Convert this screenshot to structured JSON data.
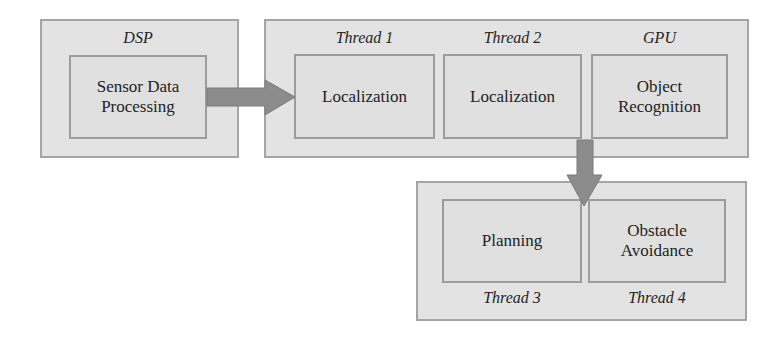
{
  "diagram": {
    "groups": [
      {
        "id": "dsp",
        "label": "DSP",
        "boxes": [
          {
            "id": "sensor-data-processing",
            "text": "Sensor Data\nProcessing"
          }
        ]
      },
      {
        "id": "compute",
        "labels": [
          "Thread 1",
          "Thread 2",
          "GPU"
        ],
        "boxes": [
          {
            "id": "localization-1",
            "text": "Localization"
          },
          {
            "id": "localization-2",
            "text": "Localization"
          },
          {
            "id": "object-recognition",
            "text": "Object\nRecognition"
          }
        ]
      },
      {
        "id": "planning-group",
        "labels": [
          "Thread 3",
          "Thread 4"
        ],
        "boxes": [
          {
            "id": "planning",
            "text": "Planning"
          },
          {
            "id": "obstacle-avoidance",
            "text": "Obstacle\nAvoidance"
          }
        ]
      }
    ],
    "arrows": [
      {
        "from": "dsp",
        "to": "compute",
        "direction": "right"
      },
      {
        "from": "compute",
        "to": "planning-group",
        "direction": "down"
      }
    ],
    "colors": {
      "group_fill": "#e3e3e3",
      "box_fill": "#e0e0e0",
      "border": "#a0a0a0",
      "arrow": "#8c8c8c",
      "text": "#232323"
    }
  }
}
